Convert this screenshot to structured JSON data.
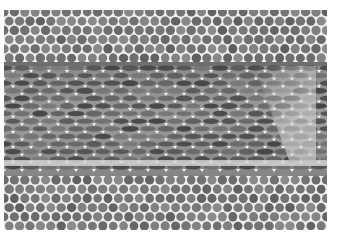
{
  "image": {
    "kind": "grayscale micrograph",
    "subject": "hexagonal close-packed cell lattice with a band of horizontally elongated cells",
    "regions": [
      {
        "name": "top-lattice",
        "pattern": "round cells",
        "y_range": [
          10,
          62
        ]
      },
      {
        "name": "middle-band",
        "pattern": "horizontally elongated cells",
        "y_range": [
          62,
          176
        ]
      },
      {
        "name": "bottom-lattice",
        "pattern": "round cells",
        "y_range": [
          176,
          230
        ]
      }
    ],
    "colors": {
      "background": "#ffffff",
      "cell_wall": "#f2f2f2",
      "cell_dark": "#6a6a6a",
      "cell_mid": "#8c8c8c",
      "band_dark": "#5a5a5a",
      "band_light": "#a8a8a8"
    }
  }
}
